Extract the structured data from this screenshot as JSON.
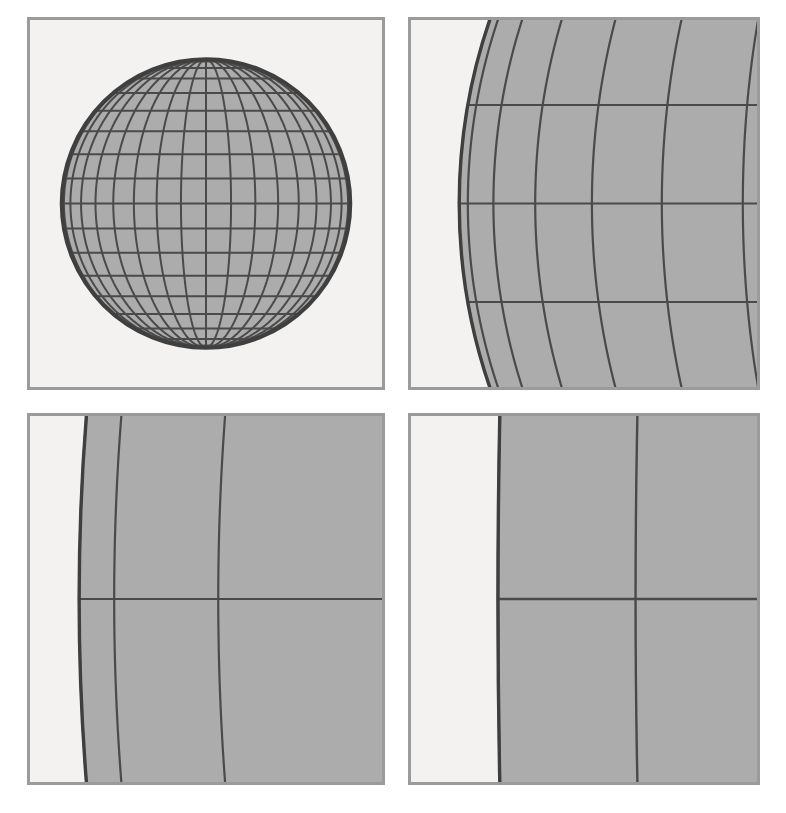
{
  "figure": {
    "layout": "2x2 panel grid",
    "background_color": "#ffffff",
    "panel_frame_color": "#9b9b9b",
    "panel_background_color": "#f3f2f0",
    "sphere_fill_color": "#acacac",
    "grid_line_color": "#4a4a4a",
    "limb_line_color": "#3f3f3f"
  },
  "chart_data": {
    "type": "scatter",
    "projection": "orthographic",
    "graticule": {
      "latitude_step_deg": 10,
      "longitude_step_deg": 10,
      "latitude_range_deg": [
        -80,
        80
      ],
      "longitude_range_deg": [
        -180,
        180
      ],
      "meridian_count": 36,
      "parallel_count": 17
    },
    "xlabel": "",
    "ylabel": "",
    "grid": false,
    "legend": null,
    "panels": [
      {
        "id": "a",
        "label": "panel-top-left",
        "position": "top-left",
        "zoom_factor": 1,
        "view_center": [
          0,
          0
        ],
        "view_half_width": 1.22,
        "sphere_radius_px": 146,
        "sphere_center_px": [
          209,
          200
        ],
        "limb_visible": "full disc",
        "caption": ""
      },
      {
        "id": "b",
        "label": "panel-top-right",
        "position": "top-right",
        "zoom_factor": 4,
        "view_center": [
          -0.78,
          0
        ],
        "view_half_width": 0.305,
        "limb_visible": "left limb, strongly curved",
        "caption": ""
      },
      {
        "id": "c",
        "label": "panel-bottom-left",
        "position": "bottom-left",
        "zoom_factor": 16,
        "view_center": [
          -0.945,
          0
        ],
        "view_half_width": 0.0763,
        "limb_visible": "left limb, mildly curved",
        "caption": ""
      },
      {
        "id": "d",
        "label": "panel-bottom-right",
        "position": "bottom-right",
        "zoom_factor": 64,
        "view_center": [
          -0.9905,
          0
        ],
        "view_half_width": 0.0191,
        "limb_visible": "left limb, nearly straight",
        "caption": ""
      }
    ]
  }
}
